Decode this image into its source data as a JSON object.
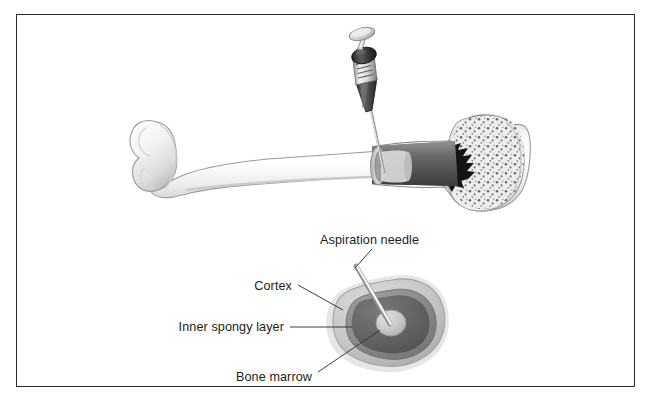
{
  "figure": {
    "border_color": "#2b2b2b",
    "background_color": "#ffffff"
  },
  "labels": {
    "aspiration_needle": "Aspiration needle",
    "cortex": "Cortex",
    "inner_spongy_layer": "Inner spongy layer",
    "bone_marrow": "Bone marrow"
  },
  "parts": {
    "bone": "long-bone",
    "syringe": "aspiration-syringe",
    "cross_section": "bone-cross-section"
  },
  "colors": {
    "bone_light": "#f2f2f2",
    "bone_shadow": "#c9c9c9",
    "bone_outline": "#8a8a8a",
    "marrow_dark": "#4a4a4a",
    "marrow_cavity": "#6e6e6e",
    "cortex_ring": "#c4c4c4",
    "spongy_layer": "#8f8f8f",
    "marrow_center": "#5f5f5f",
    "needle_metal": "#b8b8b8",
    "syringe_dark": "#3a3a3a",
    "leader_line": "#333333",
    "label_text": "#1c1c1c"
  }
}
